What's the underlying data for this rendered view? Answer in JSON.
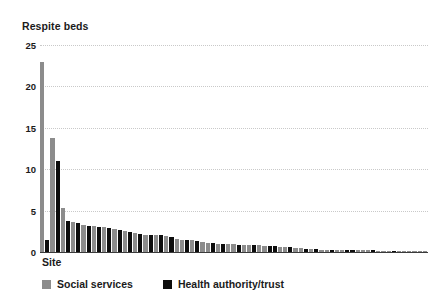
{
  "chart_data": {
    "type": "bar",
    "title": "Respite beds",
    "xlabel": "Site",
    "ylabel": "",
    "ylim": [
      0,
      25
    ],
    "yticks": [
      0,
      5,
      10,
      15,
      20,
      25
    ],
    "grid": true,
    "legend_position": "bottom-left",
    "series": [
      {
        "name": "Social services",
        "color": "#8c8c8c"
      },
      {
        "name": "Health authority/trust",
        "color": "#0d0d0d"
      }
    ],
    "bars": [
      {
        "series": "Social services",
        "value": 23.0
      },
      {
        "series": "Health authority/trust",
        "value": 1.5
      },
      {
        "series": "Social services",
        "value": 13.8
      },
      {
        "series": "Health authority/trust",
        "value": 11.0
      },
      {
        "series": "Social services",
        "value": 5.3
      },
      {
        "series": "Health authority/trust",
        "value": 3.7
      },
      {
        "series": "Social services",
        "value": 3.6
      },
      {
        "series": "Health authority/trust",
        "value": 3.5
      },
      {
        "series": "Social services",
        "value": 3.3
      },
      {
        "series": "Health authority/trust",
        "value": 3.2
      },
      {
        "series": "Social services",
        "value": 3.1
      },
      {
        "series": "Health authority/trust",
        "value": 3.0
      },
      {
        "series": "Social services",
        "value": 3.0
      },
      {
        "series": "Health authority/trust",
        "value": 2.9
      },
      {
        "series": "Social services",
        "value": 2.8
      },
      {
        "series": "Health authority/trust",
        "value": 2.6
      },
      {
        "series": "Social services",
        "value": 2.5
      },
      {
        "series": "Health authority/trust",
        "value": 2.4
      },
      {
        "series": "Social services",
        "value": 2.3
      },
      {
        "series": "Health authority/trust",
        "value": 2.2
      },
      {
        "series": "Social services",
        "value": 2.1
      },
      {
        "series": "Health authority/trust",
        "value": 2.0
      },
      {
        "series": "Social services",
        "value": 2.0
      },
      {
        "series": "Health authority/trust",
        "value": 2.0
      },
      {
        "series": "Social services",
        "value": 1.9
      },
      {
        "series": "Health authority/trust",
        "value": 1.8
      },
      {
        "series": "Social services",
        "value": 1.6
      },
      {
        "series": "Social services",
        "value": 1.5
      },
      {
        "series": "Health authority/trust",
        "value": 1.5
      },
      {
        "series": "Social services",
        "value": 1.4
      },
      {
        "series": "Health authority/trust",
        "value": 1.3
      },
      {
        "series": "Social services",
        "value": 1.2
      },
      {
        "series": "Social services",
        "value": 1.1
      },
      {
        "series": "Health authority/trust",
        "value": 1.1
      },
      {
        "series": "Social services",
        "value": 1.0
      },
      {
        "series": "Health authority/trust",
        "value": 1.0
      },
      {
        "series": "Social services",
        "value": 1.0
      },
      {
        "series": "Social services",
        "value": 1.0
      },
      {
        "series": "Health authority/trust",
        "value": 0.9
      },
      {
        "series": "Social services",
        "value": 0.9
      },
      {
        "series": "Social services",
        "value": 0.8
      },
      {
        "series": "Health authority/trust",
        "value": 0.8
      },
      {
        "series": "Social services",
        "value": 0.8
      },
      {
        "series": "Social services",
        "value": 0.7
      },
      {
        "series": "Health authority/trust",
        "value": 0.7
      },
      {
        "series": "Health authority/trust",
        "value": 0.7
      },
      {
        "series": "Social services",
        "value": 0.6
      },
      {
        "series": "Social services",
        "value": 0.6
      },
      {
        "series": "Health authority/trust",
        "value": 0.6
      },
      {
        "series": "Social services",
        "value": 0.5
      },
      {
        "series": "Social services",
        "value": 0.5
      },
      {
        "series": "Health authority/trust",
        "value": 0.4
      },
      {
        "series": "Social services",
        "value": 0.4
      },
      {
        "series": "Health authority/trust",
        "value": 0.4
      },
      {
        "series": "Social services",
        "value": 0.3
      },
      {
        "series": "Social services",
        "value": 0.3
      },
      {
        "series": "Health authority/trust",
        "value": 0.3
      },
      {
        "series": "Social services",
        "value": 0.3
      },
      {
        "series": "Social services",
        "value": 0.25
      },
      {
        "series": "Health authority/trust",
        "value": 0.25
      },
      {
        "series": "Health authority/trust",
        "value": 0.25
      },
      {
        "series": "Social services",
        "value": 0.2
      },
      {
        "series": "Social services",
        "value": 0.2
      },
      {
        "series": "Social services",
        "value": 0.2
      },
      {
        "series": "Health authority/trust",
        "value": 0.2
      },
      {
        "series": "Social services",
        "value": 0.15
      },
      {
        "series": "Social services",
        "value": 0.15
      },
      {
        "series": "Social services",
        "value": 0.15
      },
      {
        "series": "Health authority/trust",
        "value": 0.15
      },
      {
        "series": "Social services",
        "value": 0.12
      },
      {
        "series": "Social services",
        "value": 0.12
      },
      {
        "series": "Social services",
        "value": 0.1
      },
      {
        "series": "Social services",
        "value": 0.1
      },
      {
        "series": "Social services",
        "value": 0.1
      },
      {
        "series": "Social services",
        "value": 0.1
      }
    ]
  },
  "legend": {
    "social_services": "Social services",
    "health_authority": "Health authority/trust"
  },
  "axis": {
    "x_title": "Site"
  }
}
